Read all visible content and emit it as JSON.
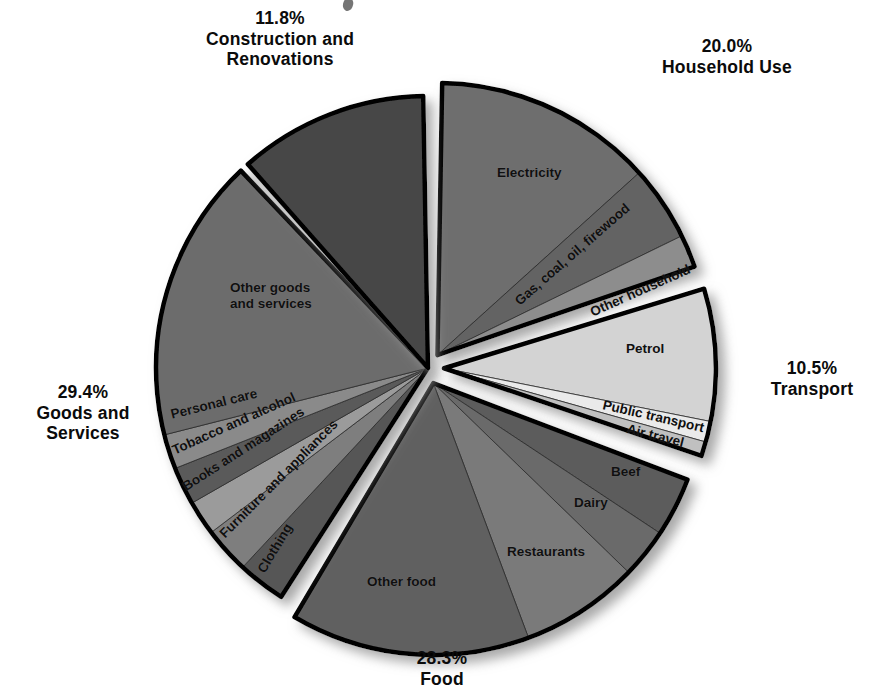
{
  "chart_data": {
    "type": "pie",
    "title": "",
    "subtitle": "",
    "xlabel": "",
    "ylabel": "",
    "legend_position": "none",
    "grid": false,
    "units": "percent",
    "total": 100.0,
    "exploded": true,
    "start_angle_deg": 0,
    "direction": "clockwise",
    "groups": [
      {
        "name": "Household Use",
        "percent_label": "20.0%",
        "value": 20.0,
        "explode": true,
        "slices": [
          {
            "label": "Electricity",
            "value": 13.4,
            "color": "#6e6e6e"
          },
          {
            "label": "Gas, coal, oil, firewood",
            "value": 4.6,
            "color": "#636363"
          },
          {
            "label": "Other household",
            "value": 2.0,
            "color": "#8d8d8d"
          }
        ]
      },
      {
        "name": "Transport",
        "percent_label": "10.5%",
        "value": 10.5,
        "explode": true,
        "slices": [
          {
            "label": "Petrol",
            "value": 8.3,
            "color": "#d3d3d3"
          },
          {
            "label": "Public transport",
            "value": 1.3,
            "color": "#eaeaea"
          },
          {
            "label": "Air travel",
            "value": 0.9,
            "color": "#c0c0c0"
          }
        ]
      },
      {
        "name": "Food",
        "percent_label": "28.3%",
        "value": 28.3,
        "explode": true,
        "slices": [
          {
            "label": "Beef",
            "value": 3.6,
            "color": "#5b5b5b"
          },
          {
            "label": "Dairy",
            "value": 3.0,
            "color": "#6a6a6a"
          },
          {
            "label": "Restaurants",
            "value": 7.2,
            "color": "#7a7a7a"
          },
          {
            "label": "Other food",
            "value": 14.5,
            "color": "#606060"
          }
        ]
      },
      {
        "name": "Goods and Services",
        "percent_label": "29.4%",
        "value": 29.4,
        "explode": false,
        "slices": [
          {
            "label": "Clothing",
            "value": 2.9,
            "color": "#565656"
          },
          {
            "label": "Furniture and appliances",
            "value": 2.8,
            "color": "#7e7e7e"
          },
          {
            "label": "Books and magazines",
            "value": 2.1,
            "color": "#9b9b9b"
          },
          {
            "label": "Tobacco and alcohol",
            "value": 2.3,
            "color": "#5a5a5a"
          },
          {
            "label": "Personal care",
            "value": 2.1,
            "color": "#8a8a8a"
          },
          {
            "label": "Other goods and services",
            "value": 17.2,
            "color": "#6c6c6c"
          }
        ]
      },
      {
        "name": "Construction and Renovations",
        "percent_label": "11.8%",
        "value": 11.8,
        "explode": false,
        "slices": [
          {
            "label": "",
            "value": 11.8,
            "color": "#474747"
          }
        ]
      }
    ]
  },
  "labels": {
    "construction": "11.8%\nConstruction and\nRenovations",
    "household": "20.0%\nHousehold Use",
    "transport": "10.5%\nTransport",
    "food": "28.3%\nFood",
    "goods": "29.4%\nGoods and\nServices",
    "slices": {
      "electricity": "Electricity",
      "gas_coal_oil_firewood": "Gas, coal, oil, firewood",
      "other_household": "Other household",
      "petrol": "Petrol",
      "public_transport": "Public transport",
      "air_travel": "Air travel",
      "beef": "Beef",
      "dairy": "Dairy",
      "restaurants": "Restaurants",
      "other_food": "Other food",
      "clothing": "Clothing",
      "furniture_and_appliances": "Furniture and appliances",
      "books_and_magazines": "Books and magazines",
      "tobacco_and_alcohol": "Tobacco and alcohol",
      "personal_care": "Personal care",
      "other_goods_and_services": "Other goods\nand services"
    }
  },
  "colors": {
    "outline": "#000000",
    "background": "#ffffff",
    "shadow": "#b8b8b8"
  }
}
